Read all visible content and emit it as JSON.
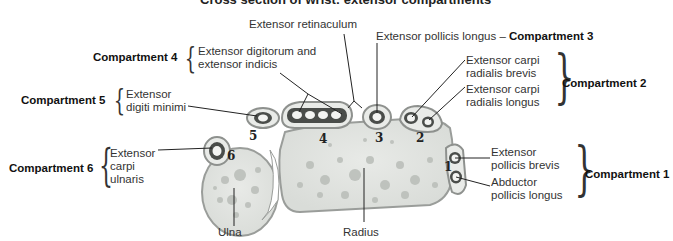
{
  "title": "Cross section of wrist: extensor compartments",
  "labels": {
    "extensor_retinaculum": "Extensor retinaculum",
    "epl": "Extensor pollicis longus",
    "epl_dash": "–",
    "comp3": "Compartment 3",
    "comp4": "Compartment 4",
    "edi_line1": "Extensor digitorum and",
    "edi_line2": "extensor indicis",
    "comp5": "Compartment 5",
    "edm_line1": "Extensor",
    "edm_line2": "digiti minimi",
    "ecrb_line1": "Extensor carpi",
    "ecrb_line2": "radialis brevis",
    "ecrl_line1": "Extensor carpi",
    "ecrl_line2": "radialis longus",
    "comp2": "Compartment 2",
    "comp6": "Compartment 6",
    "ecu_line1": "Extensor",
    "ecu_line2": "carpi",
    "ecu_line3": "ulnaris",
    "epb_line1": "Extensor",
    "epb_line2": "pollicis brevis",
    "apl_line1": "Abductor",
    "apl_line2": "pollicis longus",
    "comp1": "Compartment 1",
    "ulna": "Ulna",
    "radius": "Radius"
  },
  "compartment_numbers": [
    "1",
    "2",
    "3",
    "4",
    "5",
    "6"
  ],
  "colors": {
    "bone": "#e4e6e3",
    "bone_spot": "#b9bdb8",
    "sheath": "#5c5f5c",
    "outline": "#9a9d9a",
    "text": "#333333"
  }
}
